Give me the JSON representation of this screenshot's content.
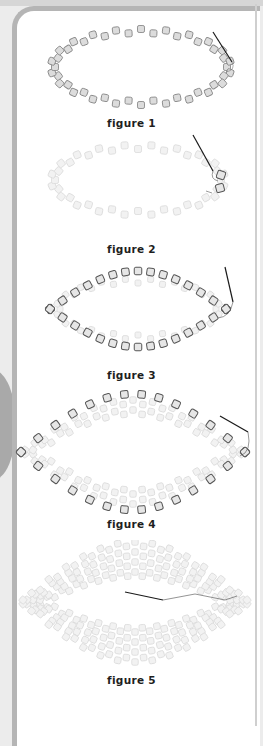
{
  "page": {
    "colors": {
      "background": "#ececec",
      "panel": "#ffffff",
      "frame": "#b5b5b5",
      "bead_fill": "#dcdcdc",
      "bead_outline": "#6e6e6e",
      "bead_faded": "#ececec",
      "thread": "#1a1a1a"
    }
  },
  "figures": [
    {
      "id": "figure-1",
      "caption": "figure 1",
      "description": "Single ring of cylinder beads strung in an oval with needle exiting at right end"
    },
    {
      "id": "figure-2",
      "caption": "figure 2",
      "description": "Faded oval ring with two highlighted beads added at the right point, needle and thread"
    },
    {
      "id": "figure-3",
      "caption": "figure 3",
      "description": "Oval with new peyote row of outlined beads added around the outside"
    },
    {
      "id": "figure-4",
      "caption": "figure 4",
      "description": "Wider oval band with outermost row of outlined beads and point beads at each end"
    },
    {
      "id": "figure-5",
      "caption": "figure 5",
      "description": "Completed faded multi-row oval band with needle weaving through the right side"
    }
  ]
}
